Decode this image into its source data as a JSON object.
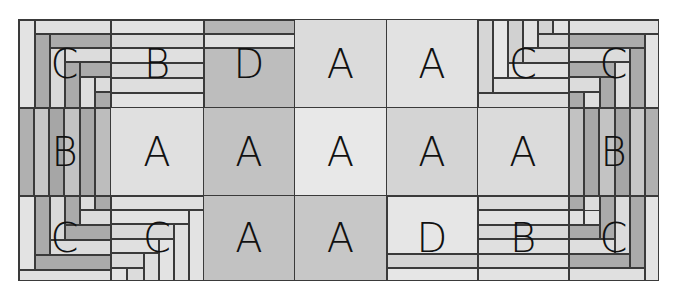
{
  "diagram": {
    "frame": {
      "left": 18,
      "top": 19,
      "width": 641,
      "height": 262
    },
    "columns": [
      0,
      92,
      185,
      276,
      368,
      459,
      550,
      641
    ],
    "rows": [
      0,
      88,
      176,
      262
    ],
    "colors": {
      "light": "#e3e3e3",
      "lighter": "#ebebeb",
      "mid": "#cfcfcf",
      "dark": "#ababab",
      "darker": "#a2a2a2",
      "line": "#3a3a3a"
    },
    "grid": [
      [
        "C",
        "B",
        "D",
        "A",
        "A",
        "C",
        "C"
      ],
      [
        "B",
        "A",
        "A",
        "A",
        "A",
        "A",
        "B"
      ],
      [
        "C",
        "C",
        "A",
        "A",
        "D",
        "B",
        "C"
      ]
    ],
    "blocks": [
      {
        "r": 0,
        "c": 0,
        "label": "C",
        "bg": "#d4d4d4",
        "strips": [
          {
            "x": 0,
            "y": 0,
            "w": 16,
            "h": 88,
            "bg": "#e3e3e3"
          },
          {
            "x": 16,
            "y": 0,
            "w": 76,
            "h": 14,
            "bg": "#e0e0e0"
          },
          {
            "x": 16,
            "y": 14,
            "w": 15,
            "h": 74,
            "bg": "#ababab"
          },
          {
            "x": 31,
            "y": 14,
            "w": 61,
            "h": 14,
            "bg": "#ababab"
          },
          {
            "x": 31,
            "y": 28,
            "w": 15,
            "h": 60,
            "bg": "#d9d9d9"
          },
          {
            "x": 46,
            "y": 28,
            "w": 46,
            "h": 14,
            "bg": "#dcdcdc"
          },
          {
            "x": 46,
            "y": 42,
            "w": 15,
            "h": 46,
            "bg": "#ababab"
          },
          {
            "x": 61,
            "y": 42,
            "w": 31,
            "h": 15,
            "bg": "#ababab"
          },
          {
            "x": 61,
            "y": 57,
            "w": 15,
            "h": 31,
            "bg": "#dedede"
          },
          {
            "x": 76,
            "y": 57,
            "w": 16,
            "h": 15,
            "bg": "#dcdcdc"
          },
          {
            "x": 76,
            "y": 72,
            "w": 16,
            "h": 16,
            "bg": "#ababab"
          }
        ]
      },
      {
        "r": 0,
        "c": 1,
        "label": "B",
        "bg": "#dedede",
        "strips": [
          {
            "x": 0,
            "y": 0,
            "w": 93,
            "h": 14,
            "bg": "#e3e3e3"
          },
          {
            "x": 0,
            "y": 14,
            "w": 93,
            "h": 14,
            "bg": "#d9d9d9"
          },
          {
            "x": 0,
            "y": 28,
            "w": 93,
            "h": 15,
            "bg": "#e0e0e0"
          },
          {
            "x": 0,
            "y": 43,
            "w": 93,
            "h": 15,
            "bg": "#d9d9d9"
          },
          {
            "x": 0,
            "y": 58,
            "w": 93,
            "h": 15,
            "bg": "#dedede"
          },
          {
            "x": 0,
            "y": 73,
            "w": 93,
            "h": 15,
            "bg": "#e3e3e3"
          }
        ]
      },
      {
        "r": 0,
        "c": 2,
        "label": "D",
        "bg": "#bdbdbd",
        "strips": [
          {
            "x": 0,
            "y": 0,
            "w": 91,
            "h": 14,
            "bg": "#b5b5b5"
          },
          {
            "x": 0,
            "y": 14,
            "w": 91,
            "h": 14,
            "bg": "#e0e0e0"
          },
          {
            "x": 0,
            "y": 28,
            "w": 91,
            "h": 60,
            "bg": "#bdbdbd"
          }
        ]
      },
      {
        "r": 0,
        "c": 3,
        "label": "A",
        "bg": "#dbdbdb",
        "strips": []
      },
      {
        "r": 0,
        "c": 4,
        "label": "A",
        "bg": "#e2e2e2",
        "strips": []
      },
      {
        "r": 0,
        "c": 5,
        "label": "C",
        "bg": "#dcdcdc",
        "strips": [
          {
            "x": 0,
            "y": 0,
            "w": 15,
            "h": 73,
            "bg": "#d6d6d6"
          },
          {
            "x": 0,
            "y": 73,
            "w": 91,
            "h": 15,
            "bg": "#dcdcdc"
          },
          {
            "x": 15,
            "y": 0,
            "w": 15,
            "h": 58,
            "bg": "#e6e6e6"
          },
          {
            "x": 15,
            "y": 58,
            "w": 76,
            "h": 15,
            "bg": "#e0e0e0"
          },
          {
            "x": 30,
            "y": 0,
            "w": 15,
            "h": 43,
            "bg": "#d1d1d1"
          },
          {
            "x": 30,
            "y": 43,
            "w": 61,
            "h": 15,
            "bg": "#e2e2e2"
          },
          {
            "x": 45,
            "y": 0,
            "w": 15,
            "h": 28,
            "bg": "#e3e3e3"
          },
          {
            "x": 45,
            "y": 28,
            "w": 46,
            "h": 15,
            "bg": "#dadada"
          },
          {
            "x": 60,
            "y": 0,
            "w": 15,
            "h": 14,
            "bg": "#d3d3d3"
          },
          {
            "x": 60,
            "y": 14,
            "w": 31,
            "h": 14,
            "bg": "#d6d6d6"
          },
          {
            "x": 75,
            "y": 0,
            "w": 16,
            "h": 14,
            "bg": "#e3e3e3"
          }
        ]
      },
      {
        "r": 0,
        "c": 6,
        "label": "C",
        "bg": "#d4d4d4",
        "strips": [
          {
            "x": 0,
            "y": 0,
            "w": 91,
            "h": 14,
            "bg": "#e0e0e0"
          },
          {
            "x": 76,
            "y": 14,
            "w": 15,
            "h": 74,
            "bg": "#e3e3e3"
          },
          {
            "x": 0,
            "y": 14,
            "w": 76,
            "h": 14,
            "bg": "#ababab"
          },
          {
            "x": 61,
            "y": 28,
            "w": 15,
            "h": 60,
            "bg": "#ababab"
          },
          {
            "x": 0,
            "y": 28,
            "w": 61,
            "h": 14,
            "bg": "#dcdcdc"
          },
          {
            "x": 46,
            "y": 42,
            "w": 15,
            "h": 46,
            "bg": "#dedede"
          },
          {
            "x": 0,
            "y": 42,
            "w": 46,
            "h": 15,
            "bg": "#ababab"
          },
          {
            "x": 31,
            "y": 57,
            "w": 15,
            "h": 31,
            "bg": "#ababab"
          },
          {
            "x": 0,
            "y": 57,
            "w": 31,
            "h": 15,
            "bg": "#dcdcdc"
          },
          {
            "x": 15,
            "y": 72,
            "w": 16,
            "h": 16,
            "bg": "#dedede"
          },
          {
            "x": 0,
            "y": 72,
            "w": 15,
            "h": 16,
            "bg": "#ababab"
          }
        ]
      },
      {
        "r": 1,
        "c": 0,
        "label": "B",
        "bg": "#b5b5b5",
        "strips": [
          {
            "x": 0,
            "y": 0,
            "w": 15,
            "h": 88,
            "bg": "#b0b0b0"
          },
          {
            "x": 15,
            "y": 0,
            "w": 15,
            "h": 88,
            "bg": "#c7c7c7"
          },
          {
            "x": 30,
            "y": 0,
            "w": 15,
            "h": 88,
            "bg": "#a6a6a6"
          },
          {
            "x": 45,
            "y": 0,
            "w": 16,
            "h": 88,
            "bg": "#c3c3c3"
          },
          {
            "x": 61,
            "y": 0,
            "w": 15,
            "h": 88,
            "bg": "#a8a8a8"
          },
          {
            "x": 76,
            "y": 0,
            "w": 16,
            "h": 88,
            "bg": "#bdbdbd"
          }
        ]
      },
      {
        "r": 1,
        "c": 1,
        "label": "A",
        "bg": "#e0e0e0",
        "strips": []
      },
      {
        "r": 1,
        "c": 2,
        "label": "A",
        "bg": "#c2c2c2",
        "strips": []
      },
      {
        "r": 1,
        "c": 3,
        "label": "A",
        "bg": "#e8e8e8",
        "strips": []
      },
      {
        "r": 1,
        "c": 4,
        "label": "A",
        "bg": "#d4d4d4",
        "strips": []
      },
      {
        "r": 1,
        "c": 5,
        "label": "A",
        "bg": "#dbdbdb",
        "strips": []
      },
      {
        "r": 1,
        "c": 6,
        "label": "B",
        "bg": "#b5b5b5",
        "strips": [
          {
            "x": 0,
            "y": 0,
            "w": 15,
            "h": 88,
            "bg": "#c2c2c2"
          },
          {
            "x": 15,
            "y": 0,
            "w": 15,
            "h": 88,
            "bg": "#a8a8a8"
          },
          {
            "x": 30,
            "y": 0,
            "w": 16,
            "h": 88,
            "bg": "#c3c3c3"
          },
          {
            "x": 46,
            "y": 0,
            "w": 15,
            "h": 88,
            "bg": "#a6a6a6"
          },
          {
            "x": 61,
            "y": 0,
            "w": 15,
            "h": 88,
            "bg": "#c7c7c7"
          },
          {
            "x": 76,
            "y": 0,
            "w": 15,
            "h": 88,
            "bg": "#b0b0b0"
          }
        ]
      },
      {
        "r": 2,
        "c": 0,
        "label": "C",
        "bg": "#d4d4d4",
        "strips": [
          {
            "x": 0,
            "y": 0,
            "w": 16,
            "h": 74,
            "bg": "#e3e3e3"
          },
          {
            "x": 0,
            "y": 74,
            "w": 92,
            "h": 12,
            "bg": "#e0e0e0"
          },
          {
            "x": 16,
            "y": 0,
            "w": 15,
            "h": 59,
            "bg": "#ababab"
          },
          {
            "x": 16,
            "y": 59,
            "w": 76,
            "h": 15,
            "bg": "#ababab"
          },
          {
            "x": 31,
            "y": 0,
            "w": 15,
            "h": 44,
            "bg": "#d9d9d9"
          },
          {
            "x": 31,
            "y": 44,
            "w": 61,
            "h": 15,
            "bg": "#dcdcdc"
          },
          {
            "x": 46,
            "y": 0,
            "w": 15,
            "h": 29,
            "bg": "#ababab"
          },
          {
            "x": 46,
            "y": 29,
            "w": 46,
            "h": 15,
            "bg": "#ababab"
          },
          {
            "x": 61,
            "y": 0,
            "w": 15,
            "h": 14,
            "bg": "#dedede"
          },
          {
            "x": 61,
            "y": 14,
            "w": 31,
            "h": 15,
            "bg": "#dcdcdc"
          },
          {
            "x": 76,
            "y": 0,
            "w": 16,
            "h": 14,
            "bg": "#ababab"
          }
        ]
      },
      {
        "r": 2,
        "c": 1,
        "label": "C",
        "bg": "#dedede",
        "strips": [
          {
            "x": 0,
            "y": 0,
            "w": 93,
            "h": 14,
            "bg": "#e0e0e0"
          },
          {
            "x": 78,
            "y": 14,
            "w": 15,
            "h": 72,
            "bg": "#e3e3e3"
          },
          {
            "x": 0,
            "y": 14,
            "w": 78,
            "h": 14,
            "bg": "#e3e3e3"
          },
          {
            "x": 63,
            "y": 28,
            "w": 15,
            "h": 58,
            "bg": "#e0e0e0"
          },
          {
            "x": 0,
            "y": 28,
            "w": 63,
            "h": 15,
            "bg": "#d9d9d9"
          },
          {
            "x": 48,
            "y": 43,
            "w": 15,
            "h": 43,
            "bg": "#e3e3e3"
          },
          {
            "x": 0,
            "y": 43,
            "w": 48,
            "h": 14,
            "bg": "#e0e0e0"
          },
          {
            "x": 33,
            "y": 57,
            "w": 15,
            "h": 29,
            "bg": "#dedede"
          },
          {
            "x": 0,
            "y": 57,
            "w": 33,
            "h": 15,
            "bg": "#d9d9d9"
          },
          {
            "x": 16,
            "y": 72,
            "w": 17,
            "h": 14,
            "bg": "#dcdcdc"
          },
          {
            "x": 0,
            "y": 72,
            "w": 16,
            "h": 14,
            "bg": "#e3e3e3"
          }
        ]
      },
      {
        "r": 2,
        "c": 2,
        "label": "A",
        "bg": "#c2c2c2",
        "strips": []
      },
      {
        "r": 2,
        "c": 3,
        "label": "A",
        "bg": "#c7c7c7",
        "strips": []
      },
      {
        "r": 2,
        "c": 4,
        "label": "D",
        "bg": "#e6e6e6",
        "strips": [
          {
            "x": 0,
            "y": 0,
            "w": 91,
            "h": 58,
            "bg": "#e6e6e6"
          },
          {
            "x": 0,
            "y": 58,
            "w": 91,
            "h": 14,
            "bg": "#d4d4d4"
          },
          {
            "x": 0,
            "y": 72,
            "w": 91,
            "h": 14,
            "bg": "#e6e6e6"
          }
        ]
      },
      {
        "r": 2,
        "c": 5,
        "label": "B",
        "bg": "#dedede",
        "strips": [
          {
            "x": 0,
            "y": 0,
            "w": 91,
            "h": 14,
            "bg": "#dcdcdc"
          },
          {
            "x": 0,
            "y": 14,
            "w": 91,
            "h": 15,
            "bg": "#e3e3e3"
          },
          {
            "x": 0,
            "y": 29,
            "w": 91,
            "h": 14,
            "bg": "#d9d9d9"
          },
          {
            "x": 0,
            "y": 43,
            "w": 91,
            "h": 15,
            "bg": "#e0e0e0"
          },
          {
            "x": 0,
            "y": 58,
            "w": 91,
            "h": 14,
            "bg": "#d9d9d9"
          },
          {
            "x": 0,
            "y": 72,
            "w": 91,
            "h": 14,
            "bg": "#e3e3e3"
          }
        ]
      },
      {
        "r": 2,
        "c": 6,
        "label": "C",
        "bg": "#d4d4d4",
        "strips": [
          {
            "x": 76,
            "y": 0,
            "w": 15,
            "h": 86,
            "bg": "#e3e3e3"
          },
          {
            "x": 0,
            "y": 72,
            "w": 76,
            "h": 14,
            "bg": "#e0e0e0"
          },
          {
            "x": 61,
            "y": 0,
            "w": 15,
            "h": 72,
            "bg": "#ababab"
          },
          {
            "x": 0,
            "y": 58,
            "w": 61,
            "h": 14,
            "bg": "#ababab"
          },
          {
            "x": 46,
            "y": 0,
            "w": 15,
            "h": 58,
            "bg": "#dcdcdc"
          },
          {
            "x": 0,
            "y": 43,
            "w": 46,
            "h": 15,
            "bg": "#dedede"
          },
          {
            "x": 31,
            "y": 0,
            "w": 15,
            "h": 43,
            "bg": "#ababab"
          },
          {
            "x": 0,
            "y": 29,
            "w": 31,
            "h": 14,
            "bg": "#ababab"
          },
          {
            "x": 15,
            "y": 0,
            "w": 16,
            "h": 29,
            "bg": "#dcdcdc"
          },
          {
            "x": 15,
            "y": 14,
            "w": 16,
            "h": 15,
            "bg": "#e3e3e3"
          },
          {
            "x": 0,
            "y": 0,
            "w": 15,
            "h": 14,
            "bg": "#ababab"
          },
          {
            "x": 0,
            "y": 14,
            "w": 15,
            "h": 15,
            "bg": "#e0e0e0"
          }
        ]
      }
    ]
  }
}
